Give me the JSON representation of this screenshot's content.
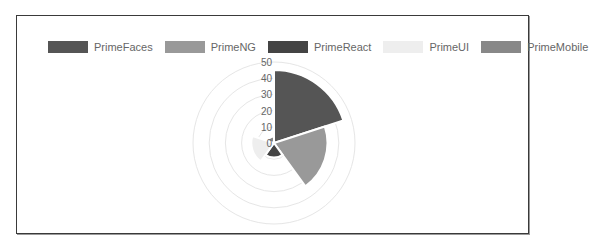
{
  "chart_data": {
    "type": "polarArea",
    "title": "",
    "categories": [
      "PrimeFaces",
      "PrimeNG",
      "PrimeReact",
      "PrimeUI",
      "PrimeMobile"
    ],
    "values": [
      45,
      33,
      9,
      14,
      4
    ],
    "colors": [
      "#555555",
      "#999999",
      "#444444",
      "#eeeeee",
      "#888888"
    ],
    "rlim": [
      0,
      50
    ],
    "r_ticks": [
      "0",
      "10",
      "20",
      "30",
      "40",
      "50"
    ],
    "grid": true,
    "legend_position": "top"
  },
  "legend": [
    {
      "label": "PrimeFaces",
      "color": "#555555"
    },
    {
      "label": "PrimeNG",
      "color": "#999999"
    },
    {
      "label": "PrimeReact",
      "color": "#444444"
    },
    {
      "label": "PrimeUI",
      "color": "#eeeeee"
    },
    {
      "label": "PrimeMobile",
      "color": "#888888"
    }
  ]
}
